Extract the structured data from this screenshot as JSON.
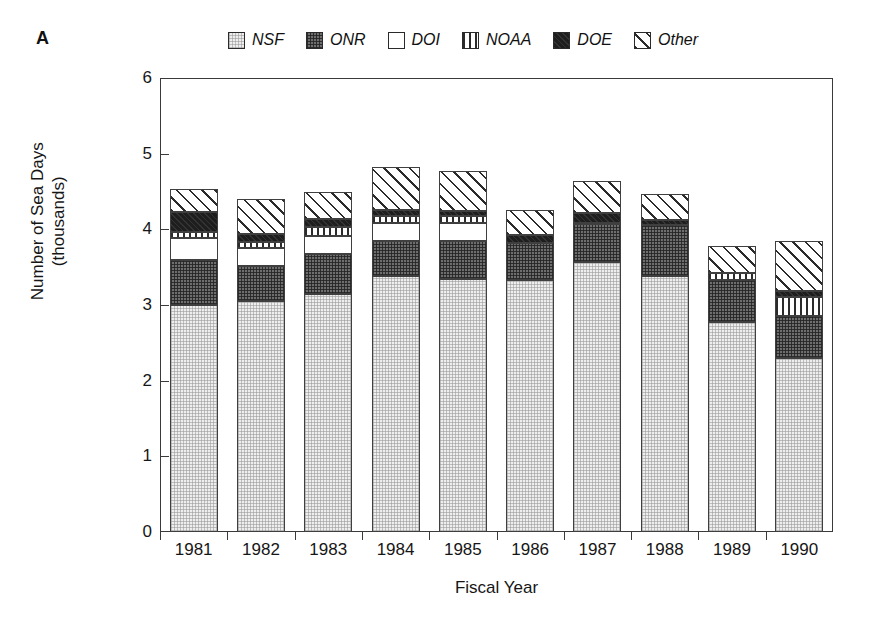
{
  "panel": {
    "label": "A"
  },
  "legend": {
    "position": "top",
    "entries": [
      {
        "label": "NSF",
        "pattern": "light-stipple",
        "color": "#eeeeee"
      },
      {
        "label": "ONR",
        "pattern": "dark-stipple",
        "color": "#6e6e6e"
      },
      {
        "label": "DOI",
        "pattern": "solid-white",
        "color": "#ffffff"
      },
      {
        "label": "NOAA",
        "pattern": "vertical-lines",
        "color": "#ffffff"
      },
      {
        "label": "DOE",
        "pattern": "solid-black",
        "color": "#1e1e1e"
      },
      {
        "label": "Other",
        "pattern": "diagonal-hatch",
        "color": "#ffffff"
      }
    ]
  },
  "axes": {
    "y_title": "Number of Sea Days (thousands)",
    "x_title": "Fiscal Year",
    "y_ticks": [
      "0",
      "1",
      "2",
      "3",
      "4",
      "5",
      "6"
    ],
    "y_min": 0,
    "y_max": 6
  },
  "chart_data": {
    "type": "bar",
    "title": "",
    "subtitle": "",
    "xlabel": "Fiscal Year",
    "ylabel": "Number of Sea Days (thousands)",
    "ylim": [
      0,
      6
    ],
    "yticks": [
      0,
      1,
      2,
      3,
      4,
      5,
      6
    ],
    "grid": false,
    "stacked": true,
    "legend_position": "top",
    "categories": [
      "1981",
      "1982",
      "1983",
      "1984",
      "1985",
      "1986",
      "1987",
      "1988",
      "1989",
      "1990"
    ],
    "series": [
      {
        "name": "NSF",
        "values": [
          3.0,
          3.05,
          3.15,
          3.38,
          3.35,
          3.33,
          3.57,
          3.38,
          2.78,
          2.3
        ]
      },
      {
        "name": "ONR",
        "values": [
          0.6,
          0.46,
          0.52,
          0.46,
          0.49,
          0.49,
          0.5,
          0.68,
          0.55,
          0.56
        ]
      },
      {
        "name": "DOI",
        "values": [
          0.28,
          0.25,
          0.24,
          0.25,
          0.25,
          0.0,
          0.0,
          0.0,
          0.0,
          0.0
        ]
      },
      {
        "name": "NOAA",
        "values": [
          0.08,
          0.07,
          0.12,
          0.09,
          0.08,
          0.0,
          0.02,
          0.0,
          0.09,
          0.25
        ]
      },
      {
        "name": "DOE",
        "values": [
          0.27,
          0.11,
          0.11,
          0.07,
          0.07,
          0.11,
          0.12,
          0.07,
          0.0,
          0.07
        ]
      },
      {
        "name": "Other",
        "values": [
          0.3,
          0.46,
          0.36,
          0.57,
          0.53,
          0.32,
          0.43,
          0.34,
          0.36,
          0.67
        ]
      }
    ],
    "totals": [
      4.53,
      4.4,
      4.5,
      4.82,
      4.77,
      4.25,
      4.64,
      4.47,
      3.78,
      3.85
    ]
  }
}
